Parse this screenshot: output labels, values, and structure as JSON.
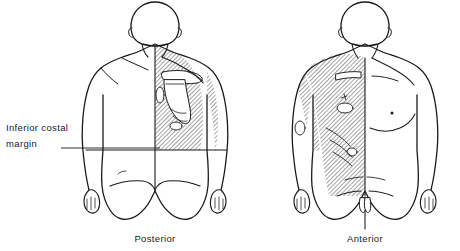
{
  "figure": {
    "title_present": false,
    "background_color": "#ffffff",
    "line_color": "#1a1a1a",
    "hatch_color": "#333333"
  },
  "annotations": {
    "costal_margin": {
      "line1": "Inferior costal",
      "line2": "margin",
      "leader_line": "leader-line-to-torso"
    }
  },
  "captions": {
    "posterior": "Posterior",
    "anterior": "Anterior"
  },
  "views": [
    {
      "name": "posterior",
      "caption": "Posterior",
      "shaded_region": "right-posterior-thorax-and-medial-upper-arm",
      "landmarks": [
        "scapula",
        "spine",
        "inferior-costal-margin",
        "gluteal-cleft"
      ]
    },
    {
      "name": "anterior",
      "caption": "Anterior",
      "shaded_region": "right-anterior-thorax-axilla-and-upper-abdomen",
      "landmarks": [
        "clavicle",
        "sternum",
        "nipple",
        "costal-margin",
        "inguinal-crease"
      ]
    }
  ]
}
